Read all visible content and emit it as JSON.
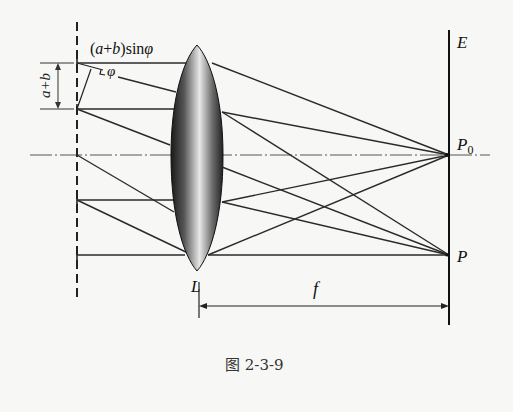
{
  "figure": {
    "caption": "图 2-3-9",
    "labels": {
      "path_difference": "(a+b)sinφ",
      "path_difference_parts": {
        "open": "(",
        "a": "a",
        "plus": "+",
        "b": "b",
        "close": ")sin",
        "phi": "φ"
      },
      "angle": "φ",
      "grating_constant": "a+b",
      "lens": "L",
      "screen": "E",
      "center_point": "P",
      "center_point_sub": "0",
      "point": "P",
      "focal_length": "f"
    },
    "colors": {
      "background": "#f7f7f5",
      "line": "#2a2a2a",
      "axis": "#555555"
    }
  }
}
